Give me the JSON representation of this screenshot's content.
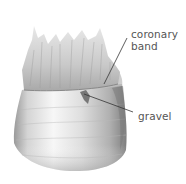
{
  "figure": {
    "labels": [
      {
        "id": "coronary-band",
        "lines": [
          "coronary",
          "band"
        ]
      },
      {
        "id": "gravel",
        "lines": [
          "gravel"
        ]
      }
    ]
  },
  "colors": {
    "background": "#ffffff",
    "label_text": "#555555",
    "leader_line": "#333333",
    "hoof_light": "#f4f4f4",
    "hoof_mid": "#c8c8c8",
    "hoof_dark": "#8a8a8a",
    "hair": "#b5b5b5"
  }
}
